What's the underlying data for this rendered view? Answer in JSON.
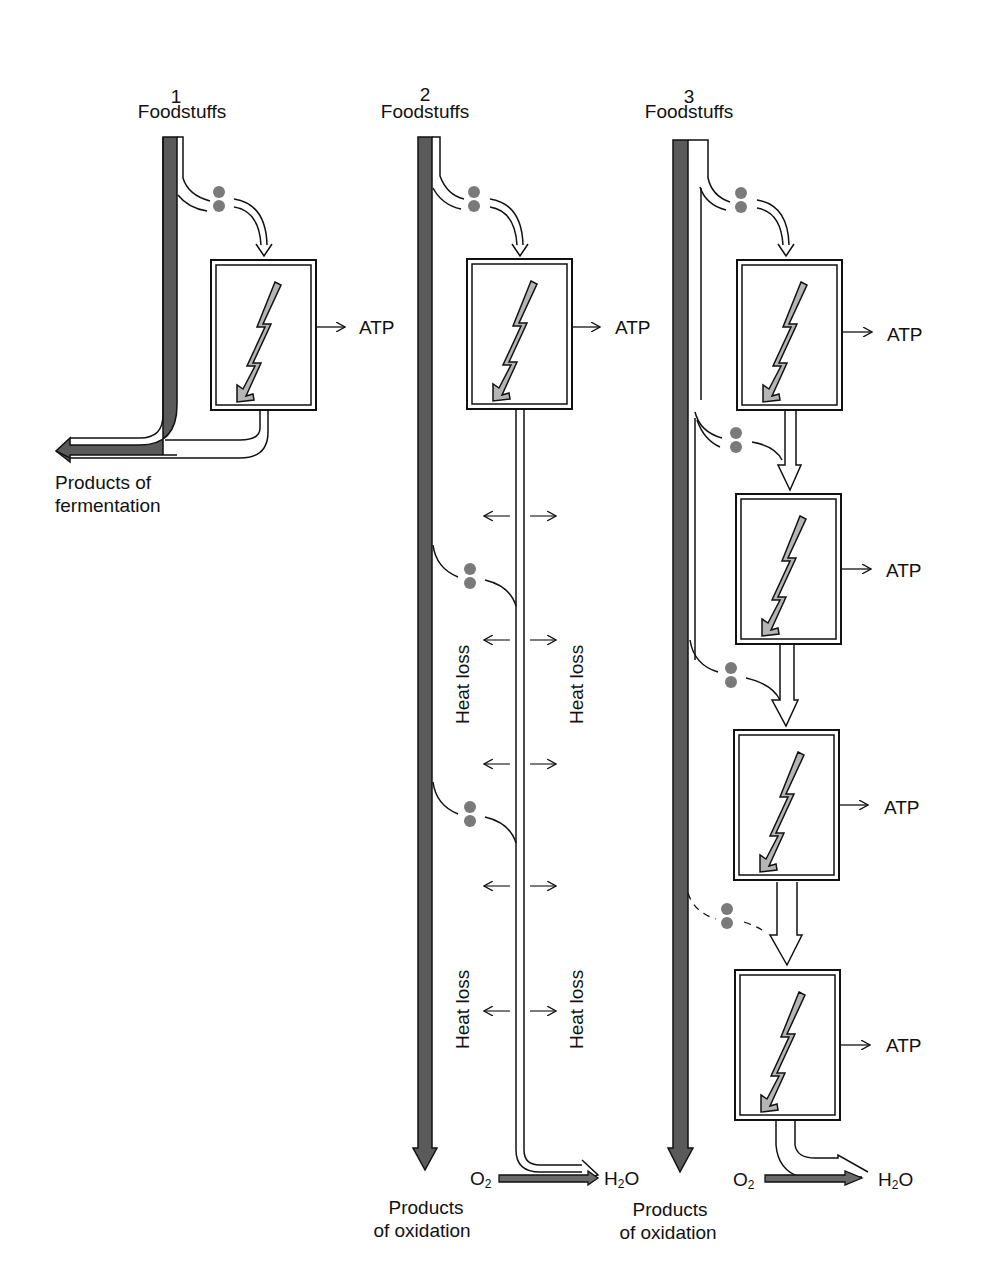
{
  "diagram": {
    "type": "energy-metabolism comparison",
    "colors": {
      "tube_dark": "#5a5a5a",
      "tube_outline": "#111111",
      "dot": "#7a7a7a",
      "lightning": "#b5b5b5",
      "o2_bar": "#6a6a6a"
    },
    "panels": [
      {
        "number": "1",
        "input_label": "Foodstuffs",
        "output_label_line1": "Products of",
        "output_label_line2": "fermentation",
        "atp_labels": [
          "ATP"
        ]
      },
      {
        "number": "2",
        "input_label": "Foodstuffs",
        "output_label_line1": "Products",
        "output_label_line2": "of oxidation",
        "atp_labels": [
          "ATP"
        ],
        "heat_loss_labels": [
          "Heat loss",
          "Heat loss",
          "Heat loss",
          "Heat loss"
        ],
        "o2_label": "O",
        "o2_sub": "2",
        "h2o_label_h": "H",
        "h2o_sub": "2",
        "h2o_label_o": "O"
      },
      {
        "number": "3",
        "input_label": "Foodstuffs",
        "output_label_line1": "Products",
        "output_label_line2": "of oxidation",
        "atp_labels": [
          "ATP",
          "ATP",
          "ATP",
          "ATP"
        ],
        "o2_label": "O",
        "o2_sub": "2",
        "h2o_label_h": "H",
        "h2o_sub": "2",
        "h2o_label_o": "O"
      }
    ]
  }
}
